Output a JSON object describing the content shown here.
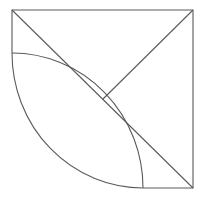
{
  "figure": {
    "title": "Geometric figure: square with quarter arc and diagonals",
    "background_color": "#ffffff",
    "stroke_color": "#5a5a5a",
    "stroke_width": 1.1,
    "canvas": {
      "width": 206,
      "height": 199
    },
    "geometry": {
      "square": {
        "top_left": [
          12,
          10
        ],
        "top_right": [
          193,
          10
        ],
        "bottom_right": [
          193,
          188
        ],
        "bottom_left": [
          12,
          188
        ],
        "width": 181,
        "height": 178
      },
      "arc": {
        "start": [
          12,
          53
        ],
        "end": [
          143,
          188
        ],
        "center": [
          12,
          188
        ],
        "radius_x": 131,
        "radius_y": 135,
        "sweep": "concave-up-right"
      },
      "points": {
        "arc_start_on_left_edge": [
          12,
          53
        ],
        "arc_end_on_bottom_edge": [
          143,
          188
        ],
        "center_intersection": [
          103,
          99
        ]
      }
    },
    "outline_path": "M 12 10 L 193 10 L 193 188 L 143 188 A 131 135 0 0 1 12 53 Z",
    "main_diagonal_path": "M 12 10 L 193 188",
    "anti_diagonal_path": "M 193 10 L 103 99",
    "arc_path": "M 12 53 A 131 135 0 0 1 143 188",
    "elements": [
      {
        "name": "outline",
        "label": "Figure outline"
      },
      {
        "name": "main-diagonal",
        "label": "Diagonal from top-left to bottom-right"
      },
      {
        "name": "anti-diagonal",
        "label": "Segment from top-right to center"
      },
      {
        "name": "arc",
        "label": "Quarter arc from left edge to bottom edge"
      }
    ]
  }
}
